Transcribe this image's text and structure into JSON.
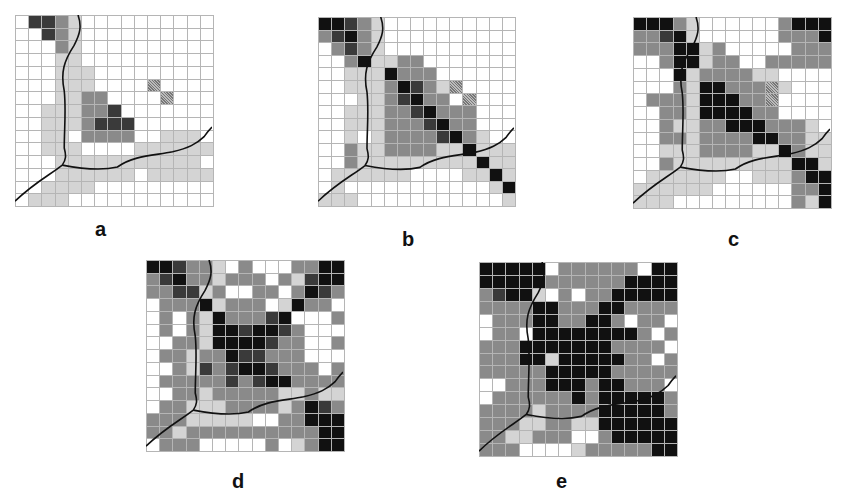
{
  "figure": {
    "panels": [
      {
        "id": "a",
        "label": "a",
        "x": 15,
        "y": 15,
        "w": 197,
        "h": 190,
        "label_x": 95,
        "label_y": 218,
        "cells": [
          "033210000000000",
          "003210000000000",
          "000210000000000",
          "000110000000000",
          "000111000000000",
          "000111000050000",
          "000112200005000",
          "001112230000000",
          "001112333000000",
          "001102222001110",
          "001110000111111",
          "000111111111110",
          "000111111011111",
          "001111000000000",
          "011100000000000"
        ]
      },
      {
        "id": "b",
        "label": "b",
        "x": 318,
        "y": 17,
        "w": 196,
        "h": 188,
        "label_x": 402,
        "label_y": 228,
        "cells": [
          "443210000000000",
          "234210000000000",
          "023210000000000",
          "002411220000000",
          "001114222000000",
          "001112432150000",
          "000112342205000",
          "001112234222000",
          "001112223422000",
          "001012222342100",
          "002112222114111",
          "002111111111411",
          "011111100001141",
          "010000000000014",
          "111000000000001"
        ]
      },
      {
        "id": "c",
        "label": "c",
        "x": 633,
        "y": 17,
        "w": 197,
        "h": 190,
        "label_x": 728,
        "label_y": 228,
        "cells": [
          "444210000002444",
          "223410000002224",
          "222441200000222",
          "002441220022222",
          "000412222110000",
          "000214422251000",
          "022214442250000",
          "002214444220000",
          "002112244422210",
          "002212222442211",
          "001112222114211",
          "002111111111441",
          "011111100111244",
          "111111000000224",
          "111000000000214"
        ]
      },
      {
        "id": "d",
        "label": "d",
        "x": 146,
        "y": 260,
        "w": 197,
        "h": 190,
        "label_x": 232,
        "label_y": 470,
        "cells": [
          "443221020002244",
          "234221222021344",
          "223312002202432",
          "022241222014220",
          "020214222340002",
          "020214434432000",
          "002214444322002",
          "022122433222000",
          "002132344322202",
          "022222323442222",
          "002212222211211",
          "022111222212432",
          "222111110022444",
          "221222222222244",
          "022200000201244"
        ]
      },
      {
        "id": "e",
        "label": "e",
        "x": 479,
        "y": 262,
        "w": 197,
        "h": 193,
        "label_x": 556,
        "label_y": 470,
        "cells": [
          "444440222222044",
          "444442222224444",
          "234410202244444",
          "222244222442222",
          "022244224420220",
          "022044444444202",
          "222444444422220",
          "222441444442202",
          "222224444422222",
          "002224442442220",
          "022222242444442",
          "222212222444442",
          "222112211444444",
          "221122200244444",
          "222000012222244"
        ]
      }
    ]
  },
  "colors": {
    "white": "#ffffff",
    "light": "#d4d4d4",
    "mid": "#8a8a8a",
    "dark": "#3a3a3a",
    "black": "#111111",
    "gridline": "#b5b5b5",
    "river": "#111111"
  }
}
